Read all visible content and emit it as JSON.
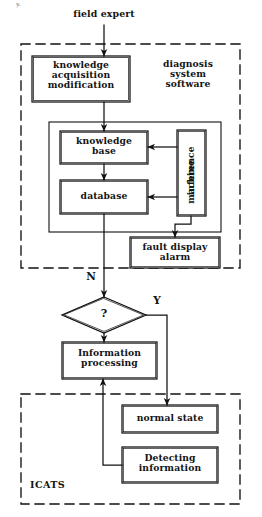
{
  "diagram": {
    "type": "flowchart",
    "title_artifact": "y.",
    "external_actor": {
      "label": "field expert"
    },
    "groups": [
      {
        "id": "diagnosis-system-software",
        "label": "diagnosis\nsystem\nsoftware",
        "label_lines": [
          "diagnosis",
          "system",
          "software"
        ],
        "style": "dashed"
      },
      {
        "id": "icats",
        "label": "ICATS",
        "style": "dashed"
      }
    ],
    "nodes": [
      {
        "id": "knowledge-acquisition-modification",
        "shape": "rect",
        "lines": [
          "knowledge",
          "acquisition",
          "modification"
        ]
      },
      {
        "id": "knowledge-base",
        "shape": "rect",
        "lines": [
          "knowledge",
          "base"
        ]
      },
      {
        "id": "database",
        "shape": "rect",
        "lines": [
          "database"
        ]
      },
      {
        "id": "inference-machine",
        "shape": "rect",
        "orientation": "vertical",
        "lines": [
          "inference",
          "machine"
        ]
      },
      {
        "id": "fault-display-alarm",
        "shape": "rect",
        "lines": [
          "fault display",
          "alarm"
        ]
      },
      {
        "id": "decision",
        "shape": "diamond",
        "lines": [
          "?"
        ]
      },
      {
        "id": "information-processing",
        "shape": "rect",
        "lines": [
          "Information",
          "processing"
        ]
      },
      {
        "id": "normal-state",
        "shape": "rect",
        "lines": [
          "normal state"
        ]
      },
      {
        "id": "detecting-information",
        "shape": "rect",
        "lines": [
          "Detecting",
          "information"
        ]
      }
    ],
    "edge_labels": {
      "no": "N",
      "yes": "Y"
    },
    "colors": {
      "line": "#111111",
      "text": "#141414",
      "background": "#ffffff"
    }
  }
}
